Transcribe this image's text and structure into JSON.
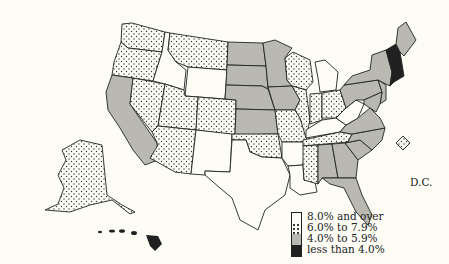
{
  "map": {
    "type": "choropleth",
    "region": "United States",
    "categories": [
      {
        "id": "c1",
        "label": "8.0% and over",
        "pattern": "white"
      },
      {
        "id": "c2",
        "label": "6.0% to 7.9%",
        "pattern": "dotted"
      },
      {
        "id": "c3",
        "label": "4.0% to 5.9%",
        "pattern": "gray"
      },
      {
        "id": "c4",
        "label": "less than 4.0%",
        "pattern": "black"
      }
    ],
    "dc_label": "D.C.",
    "states": {
      "WA": "c2",
      "OR": "c2",
      "CA": "c3",
      "NV": "c2",
      "ID": "c1",
      "MT": "c2",
      "WY": "c1",
      "UT": "c2",
      "AZ": "c2",
      "CO": "c2",
      "NM": "c1",
      "ND": "c3",
      "SD": "c3",
      "NE": "c3",
      "KS": "c3",
      "OK": "c2",
      "TX": "c1",
      "MN": "c3",
      "IA": "c3",
      "MO": "c2",
      "AR": "c1",
      "LA": "c1",
      "WI": "c2",
      "IL": "c2",
      "MI": "c1",
      "IN": "c2",
      "OH": "c2",
      "KY": "c1",
      "TN": "c2",
      "MS": "c2",
      "AL": "c3",
      "GA": "c3",
      "FL": "c3",
      "SC": "c3",
      "NC": "c3",
      "VA": "c3",
      "WV": "c1",
      "PA": "c3",
      "NY": "c3",
      "NJ": "c3",
      "MD": "c3",
      "DE": "c3",
      "CT": "c4",
      "MA": "c4",
      "VT": "c4",
      "NH": "c4",
      "ME": "c3",
      "RI": "c4",
      "AK": "c2",
      "HI": "c4",
      "DC": "c2"
    }
  }
}
